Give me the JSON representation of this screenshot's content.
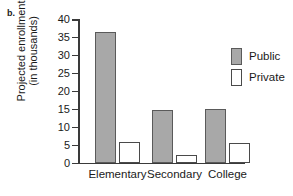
{
  "panel": {
    "label": "b."
  },
  "legend": {
    "position": "right",
    "entries": [
      {
        "label": "Public",
        "swatch": "filled-gray-square",
        "color": "#a8a8a8"
      },
      {
        "label": "Private",
        "swatch": "open-white-square",
        "color": "#ffffff"
      }
    ]
  },
  "chart_data": {
    "type": "bar",
    "title": "",
    "subtitle": "",
    "xlabel": "",
    "ylabel": "Projected enrollment (in thousands)",
    "ylabel_lines": [
      "Projected enrollment",
      "(in thousands)"
    ],
    "categories": [
      "Elementary",
      "Secondary",
      "College"
    ],
    "series": [
      {
        "name": "Public",
        "color": "#a8a8a8",
        "values": [
          36.5,
          14.5,
          15.0
        ]
      },
      {
        "name": "Private",
        "color": "#ffffff",
        "values": [
          5.7,
          2.0,
          5.5
        ]
      }
    ],
    "ylim": [
      0,
      40
    ],
    "yticks": [
      0,
      5,
      10,
      15,
      20,
      25,
      30,
      35,
      40
    ],
    "ytick_labels": [
      "0",
      "5",
      "10",
      "15",
      "20",
      "25",
      "30",
      "35",
      "40"
    ],
    "grid": false,
    "legend_position": "right"
  }
}
